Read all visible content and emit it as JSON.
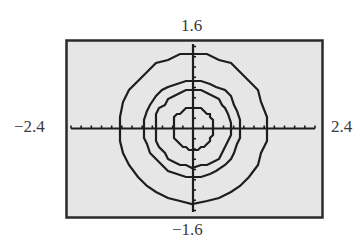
{
  "chart_data": {
    "type": "line",
    "title": "",
    "xlabel": "",
    "ylabel": "",
    "xlim": [
      -2.4,
      2.4
    ],
    "ylim": [
      -1.6,
      1.6
    ],
    "xscale": 0.2,
    "yscale": 0.2,
    "grid": false,
    "legend": null,
    "window_labels": {
      "xmin": "−2.4",
      "xmax": "2.4",
      "ymin": "−1.6",
      "ymax": "1.6"
    },
    "series": [
      {
        "name": "circle-1",
        "shape": "circle",
        "center": [
          0,
          0
        ],
        "radius": 0.4
      },
      {
        "name": "circle-2",
        "shape": "circle",
        "center": [
          0,
          0
        ],
        "radius": 0.75
      },
      {
        "name": "circle-3",
        "shape": "circle",
        "center": [
          0,
          0
        ],
        "radius": 0.95
      },
      {
        "name": "circle-4",
        "shape": "circle",
        "center": [
          0,
          0
        ],
        "radius": 1.45
      }
    ]
  },
  "colors": {
    "screen_bg": "#e6e6e6",
    "frame": "#2a2a2a",
    "ink": "#1e1e1e"
  }
}
